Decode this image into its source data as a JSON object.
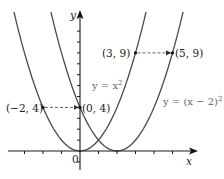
{
  "chart_data": {
    "type": "line",
    "title": "",
    "xlabel": "x",
    "ylabel": "y",
    "origin_label": "0",
    "xlim": [
      -3.9,
      6.2
    ],
    "ylim": [
      -1.7,
      12.8
    ],
    "x_ticks": [
      -3,
      -2,
      -1,
      0,
      1,
      2,
      3,
      4,
      5
    ],
    "y_ticks": [
      -1,
      1,
      2,
      3,
      4,
      5,
      6,
      7,
      8,
      9,
      10,
      11
    ],
    "tick_labels_shown": false,
    "grid": false,
    "series": [
      {
        "name": "y = x²",
        "formula": "x^2",
        "color": "#4a4a4a"
      },
      {
        "name": "y = (x − 2)²",
        "formula": "(x-2)^2",
        "color": "#4a4a4a"
      }
    ],
    "points": [
      {
        "label": "(−2, 4)",
        "x": -2,
        "y": 4
      },
      {
        "label": "(0, 4)",
        "x": 0,
        "y": 4
      },
      {
        "label": "(3, 9)",
        "x": 3,
        "y": 9
      },
      {
        "label": "(5, 9)",
        "x": 5,
        "y": 9
      }
    ],
    "annotations": [
      {
        "type": "dashed-arrow",
        "from": [
          -2,
          4
        ],
        "to": [
          0,
          4
        ]
      },
      {
        "type": "dashed-arrow",
        "from": [
          3,
          9
        ],
        "to": [
          5,
          9
        ]
      }
    ]
  },
  "labels": {
    "x_axis": "x",
    "y_axis": "y",
    "origin": "0",
    "curve1": "y = x",
    "curve1_sup": "2",
    "curve2": "y = (x − 2)",
    "curve2_sup": "2",
    "pt_m2_4": "(−2, 4)",
    "pt_0_4": "(0, 4)",
    "pt_3_9": "(3, 9)",
    "pt_5_9": "(5, 9)"
  }
}
